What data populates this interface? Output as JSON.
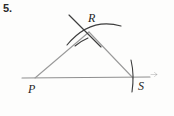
{
  "figure": {
    "problem_number": "5.",
    "type": "compass-and-straightedge construction",
    "background_color": "#fdfdfc",
    "line_color": "#9a9a9a",
    "arc_color": "#3a3a3a",
    "label_color": "#1f1f1f",
    "vertices": [
      {
        "id": "P",
        "label": "P",
        "x": 35,
        "y": 78
      },
      {
        "id": "R",
        "label": "R",
        "x": 89,
        "y": 32
      },
      {
        "id": "S",
        "label": "S",
        "x": 133,
        "y": 78
      }
    ],
    "segments": [
      {
        "name": "base-line-PS-extended",
        "x1": 22,
        "y1": 78,
        "x2": 150,
        "y2": 77
      },
      {
        "name": "side-PR",
        "x1": 35,
        "y1": 78,
        "x2": 89,
        "y2": 32
      },
      {
        "name": "side-RS",
        "x1": 89,
        "y1": 32,
        "x2": 133,
        "y2": 78
      }
    ],
    "arcs": [
      {
        "name": "arc-upper-left-to-lower-right",
        "d": "M 69 15 L 101 47"
      },
      {
        "name": "arc-curved-through-R",
        "d": "M 67 45 Q 90 18 120 26"
      },
      {
        "name": "arc-tick-below-R",
        "d": "M 76 45 Q 82 40 88 37"
      },
      {
        "name": "arc-tick-at-S",
        "d": "M 131 61 Q 134 74 132 91"
      }
    ],
    "ray_marker": {
      "name": "ray-arrow-right",
      "x": 154,
      "y": 74
    },
    "labels": {
      "P": "P",
      "R": "R",
      "S": "S"
    }
  }
}
